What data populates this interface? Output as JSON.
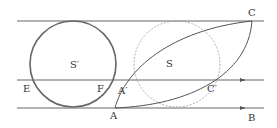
{
  "diagram": {
    "line_color": "#555555",
    "circle_color": "#666666",
    "dashed_color": "#888888",
    "labels": {
      "S_prime": "S′",
      "S": "S",
      "E": "E",
      "F": "F",
      "A_prime": "A′",
      "A": "A",
      "C": "C",
      "C_prime": "C′",
      "B": "B"
    }
  }
}
